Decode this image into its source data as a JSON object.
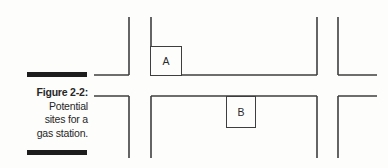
{
  "figure": {
    "label": "Figure 2-2:",
    "caption_lines": [
      "Potential",
      "sites for a",
      "gas station."
    ]
  },
  "diagram": {
    "type": "street-map",
    "background_color": "#fdfdfc",
    "line_color": "#3e3e3e",
    "rule_color": "#1d1d1d",
    "sites": [
      {
        "label": "A",
        "x": 150,
        "y": 46,
        "w": 32,
        "h": 30
      },
      {
        "label": "B",
        "x": 226,
        "y": 96,
        "w": 30,
        "h": 32
      }
    ],
    "segments": [
      {
        "name": "horiz-top-left",
        "x1": 94,
        "y1": 75,
        "x2": 129,
        "y2": 75
      },
      {
        "name": "horiz-top-middle",
        "x1": 151,
        "y1": 75,
        "x2": 317,
        "y2": 75
      },
      {
        "name": "horiz-top-right",
        "x1": 338,
        "y1": 75,
        "x2": 377,
        "y2": 75
      },
      {
        "name": "horiz-bottom-left",
        "x1": 94,
        "y1": 96,
        "x2": 129,
        "y2": 96
      },
      {
        "name": "horiz-bottom-middle",
        "x1": 151,
        "y1": 96,
        "x2": 317,
        "y2": 96
      },
      {
        "name": "horiz-bottom-right",
        "x1": 338,
        "y1": 96,
        "x2": 377,
        "y2": 96
      },
      {
        "name": "vert1-upper",
        "x1": 129,
        "y1": 17,
        "x2": 129,
        "y2": 75
      },
      {
        "name": "vert1-lower",
        "x1": 129,
        "y1": 96,
        "x2": 129,
        "y2": 158
      },
      {
        "name": "vert2-upper",
        "x1": 151,
        "y1": 17,
        "x2": 151,
        "y2": 75
      },
      {
        "name": "vert2-lower",
        "x1": 151,
        "y1": 96,
        "x2": 151,
        "y2": 158
      },
      {
        "name": "vert3-upper",
        "x1": 317,
        "y1": 17,
        "x2": 317,
        "y2": 75
      },
      {
        "name": "vert3-lower",
        "x1": 317,
        "y1": 96,
        "x2": 317,
        "y2": 158
      },
      {
        "name": "vert4-upper",
        "x1": 338,
        "y1": 17,
        "x2": 338,
        "y2": 75
      },
      {
        "name": "vert4-lower",
        "x1": 338,
        "y1": 96,
        "x2": 338,
        "y2": 158
      }
    ]
  }
}
